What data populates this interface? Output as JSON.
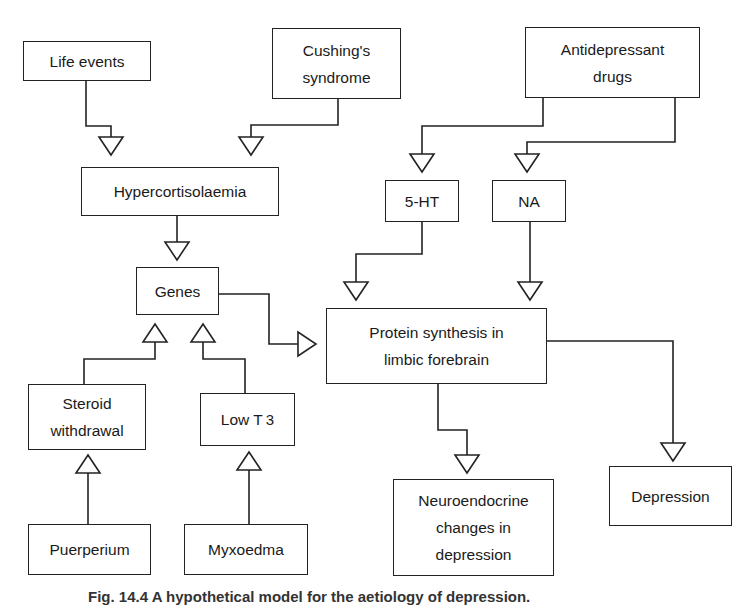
{
  "diagram": {
    "nodes": [
      {
        "id": "life_events",
        "label": "Life events",
        "x": 23,
        "y": 41,
        "w": 128,
        "h": 40
      },
      {
        "id": "cushings",
        "label": "Cushing's\nsyndrome",
        "x": 272,
        "y": 28,
        "w": 129,
        "h": 71
      },
      {
        "id": "antidepressant",
        "label": "Antidepressant\ndrugs",
        "x": 525,
        "y": 27,
        "w": 175,
        "h": 71
      },
      {
        "id": "hypercortisolaemia",
        "label": "Hypercortisolaemia",
        "x": 81,
        "y": 167,
        "w": 198,
        "h": 49
      },
      {
        "id": "five_ht",
        "label": "5-HT",
        "x": 385,
        "y": 180,
        "w": 74,
        "h": 42
      },
      {
        "id": "na",
        "label": "NA",
        "x": 492,
        "y": 180,
        "w": 74,
        "h": 42
      },
      {
        "id": "genes",
        "label": "Genes",
        "x": 136,
        "y": 267,
        "w": 83,
        "h": 48
      },
      {
        "id": "protein_synthesis",
        "label": "Protein synthesis in\nlimbic forebrain",
        "x": 326,
        "y": 308,
        "w": 221,
        "h": 76
      },
      {
        "id": "steroid_withdrawal",
        "label": "Steroid\nwithdrawal",
        "x": 28,
        "y": 384,
        "w": 118,
        "h": 66
      },
      {
        "id": "low_t3",
        "label": "Low T",
        "sub": "3",
        "x": 200,
        "y": 393,
        "w": 95,
        "h": 53
      },
      {
        "id": "neuroendocrine",
        "label": "Neuroendocrine\nchanges in\ndepression",
        "x": 393,
        "y": 479,
        "w": 161,
        "h": 97
      },
      {
        "id": "depression",
        "label": "Depression",
        "x": 609,
        "y": 466,
        "w": 123,
        "h": 60
      },
      {
        "id": "puerperium",
        "label": "Puerperium",
        "x": 28,
        "y": 524,
        "w": 123,
        "h": 51
      },
      {
        "id": "myxoedma",
        "label": "Myxoedma",
        "x": 184,
        "y": 524,
        "w": 124,
        "h": 51
      }
    ],
    "edges": [
      {
        "from": "life_events",
        "to": "hypercortisolaemia",
        "path": [
          [
            86,
            81
          ],
          [
            86,
            126
          ],
          [
            111,
            126
          ],
          [
            111,
            138
          ]
        ],
        "arrow": "down",
        "tip": [
          111,
          155
        ]
      },
      {
        "from": "cushings",
        "to": "hypercortisolaemia",
        "path": [
          [
            338,
            99
          ],
          [
            338,
            125
          ],
          [
            251,
            125
          ],
          [
            251,
            138
          ]
        ],
        "arrow": "down",
        "tip": [
          251,
          155
        ]
      },
      {
        "from": "antidepressant",
        "to": "five_ht",
        "path": [
          [
            543,
            98
          ],
          [
            543,
            126
          ],
          [
            422,
            126
          ],
          [
            422,
            154
          ]
        ],
        "arrow": "down",
        "tip": [
          422,
          172
        ]
      },
      {
        "from": "antidepressant",
        "to": "na",
        "path": [
          [
            675,
            98
          ],
          [
            675,
            142
          ],
          [
            527,
            142
          ],
          [
            527,
            154
          ]
        ],
        "arrow": "down",
        "tip": [
          527,
          172
        ]
      },
      {
        "from": "hypercortisolaemia",
        "to": "genes",
        "path": [
          [
            177,
            216
          ],
          [
            177,
            242
          ]
        ],
        "arrow": "down",
        "tip": [
          177,
          260
        ]
      },
      {
        "from": "five_ht",
        "to": "protein_synthesis",
        "path": [
          [
            422,
            222
          ],
          [
            422,
            254
          ],
          [
            356,
            254
          ],
          [
            356,
            282
          ]
        ],
        "arrow": "down",
        "tip": [
          356,
          300
        ]
      },
      {
        "from": "na",
        "to": "protein_synthesis",
        "path": [
          [
            530,
            222
          ],
          [
            530,
            282
          ]
        ],
        "arrow": "down",
        "tip": [
          530,
          300
        ]
      },
      {
        "from": "genes",
        "to": "protein_synthesis",
        "path": [
          [
            219,
            294
          ],
          [
            269,
            294
          ],
          [
            269,
            344
          ],
          [
            299,
            344
          ]
        ],
        "arrow": "right",
        "tip": [
          316,
          344
        ]
      },
      {
        "from": "steroid_withdrawal",
        "to": "genes",
        "path": [
          [
            84,
            384
          ],
          [
            84,
            359
          ],
          [
            155,
            359
          ],
          [
            155,
            342
          ]
        ],
        "arrow": "up",
        "tip": [
          155,
          324
        ]
      },
      {
        "from": "low_t3",
        "to": "genes",
        "path": [
          [
            245,
            393
          ],
          [
            245,
            359
          ],
          [
            203,
            359
          ],
          [
            203,
            342
          ]
        ],
        "arrow": "up",
        "tip": [
          203,
          324
        ]
      },
      {
        "from": "protein_synthesis",
        "to": "neuroendocrine",
        "path": [
          [
            438,
            384
          ],
          [
            438,
            430
          ],
          [
            467,
            430
          ],
          [
            467,
            455
          ]
        ],
        "arrow": "down",
        "tip": [
          467,
          473
        ]
      },
      {
        "from": "protein_synthesis",
        "to": "depression",
        "path": [
          [
            547,
            341
          ],
          [
            673,
            341
          ],
          [
            673,
            443
          ]
        ],
        "arrow": "down",
        "tip": [
          673,
          461
        ]
      },
      {
        "from": "puerperium",
        "to": "steroid_withdrawal",
        "path": [
          [
            88,
            524
          ],
          [
            88,
            473
          ]
        ],
        "arrow": "up",
        "tip": [
          88,
          455
        ]
      },
      {
        "from": "myxoedma",
        "to": "low_t3",
        "path": [
          [
            249,
            524
          ],
          [
            249,
            470
          ]
        ],
        "arrow": "up",
        "tip": [
          249,
          452
        ]
      }
    ],
    "caption": "Fig. 14.4  A hypothetical model for the aetiology of depression."
  }
}
